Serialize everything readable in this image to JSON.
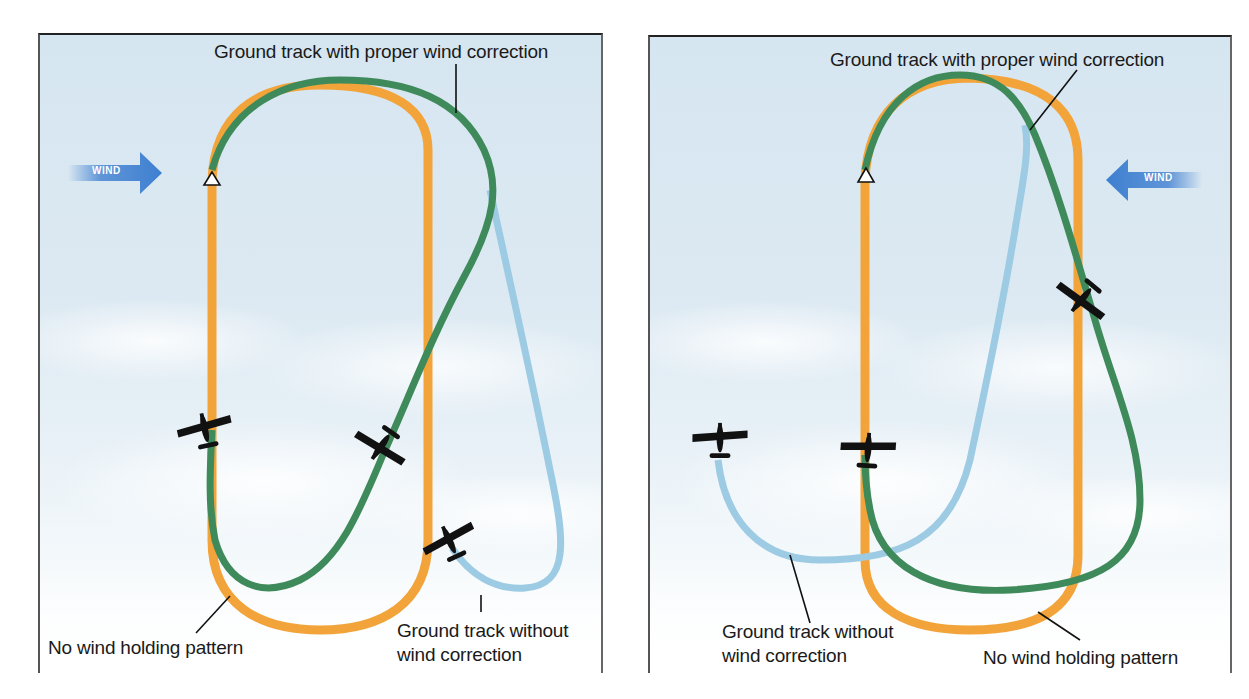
{
  "figure": {
    "colors": {
      "no_wind_pattern": "#f2a43a",
      "with_wind_correction": "#3f8a5a",
      "without_wind_correction": "#9ccbe3",
      "wind_arrow": "#3d7fd0",
      "leader_line": "#111111",
      "airplane": "#111111"
    },
    "left_panel": {
      "wind": {
        "label": "WIND",
        "direction": "right"
      },
      "labels": {
        "with_correction": "Ground track with proper wind correction",
        "no_wind": "No wind holding pattern",
        "without_correction_line1": "Ground track without",
        "without_correction_line2": "wind correction"
      },
      "fix_marker": "triangle-icon",
      "airplanes": 3
    },
    "right_panel": {
      "wind": {
        "label": "WIND",
        "direction": "left"
      },
      "labels": {
        "with_correction": "Ground track with proper  wind correction",
        "no_wind": "No wind holding pattern",
        "without_correction_line1": "Ground track without",
        "without_correction_line2": "wind correction"
      },
      "fix_marker": "triangle-icon",
      "airplanes": 3
    },
    "caption": {
      "visible": "partially cut off"
    }
  }
}
